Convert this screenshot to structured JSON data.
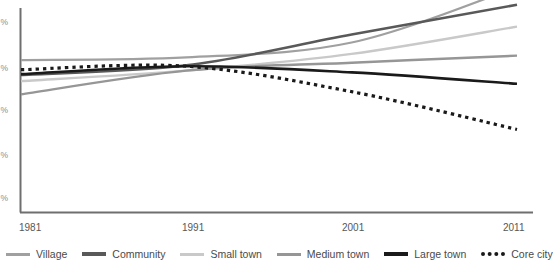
{
  "chart_data": {
    "type": "line",
    "title": "",
    "subtitle": "",
    "xlabel": "",
    "ylabel": "%",
    "x": [
      1981,
      1991,
      2001,
      2011
    ],
    "xtick_labels": [
      "1981",
      "1991",
      "2001",
      "2011"
    ],
    "ytick_labels": [
      "%",
      "%",
      "%",
      "%",
      "%"
    ],
    "ytick_values": [
      25,
      20,
      15,
      10,
      5
    ],
    "ylim": [
      3,
      26
    ],
    "xlim": [
      1981,
      2011
    ],
    "grid": false,
    "legend_position": "bottom",
    "series": [
      {
        "name": "Village",
        "color": "#a0a0a0",
        "style": "solid",
        "width": 2.2,
        "values": [
          20.3,
          20.6,
          22.3,
          28.6
        ]
      },
      {
        "name": "Community",
        "color": "#595959",
        "style": "solid",
        "width": 2.6,
        "values": [
          18.6,
          19.7,
          23.2,
          26.6
        ]
      },
      {
        "name": "Small town",
        "color": "#c9c9c9",
        "style": "solid",
        "width": 2.4,
        "values": [
          17.9,
          19.1,
          21.0,
          24.1
        ]
      },
      {
        "name": "Medium town",
        "color": "#969696",
        "style": "solid",
        "width": 2.4,
        "values": [
          16.4,
          19.1,
          20.0,
          20.8
        ]
      },
      {
        "name": "Large town",
        "color": "#1a1a1a",
        "style": "solid",
        "width": 2.6,
        "values": [
          18.7,
          19.6,
          18.9,
          17.6
        ]
      },
      {
        "name": "Core city",
        "color": "#1a1a1a",
        "style": "dotted",
        "width": 3.2,
        "values": [
          19.2,
          19.6,
          16.7,
          12.4
        ]
      }
    ]
  },
  "axes": {
    "axis_color": "#6f6f6f",
    "tick_label_color": "#575757"
  },
  "legend": {
    "items": [
      {
        "label": "Village",
        "swatch": "line-swatch-village"
      },
      {
        "label": "Community",
        "swatch": "line-swatch-community"
      },
      {
        "label": "Small town",
        "swatch": "line-swatch-small-town"
      },
      {
        "label": "Medium town",
        "swatch": "line-swatch-medium-town"
      },
      {
        "label": "Large town",
        "swatch": "line-swatch-large-town"
      },
      {
        "label": "Core city",
        "swatch": "line-swatch-core-city"
      }
    ]
  }
}
